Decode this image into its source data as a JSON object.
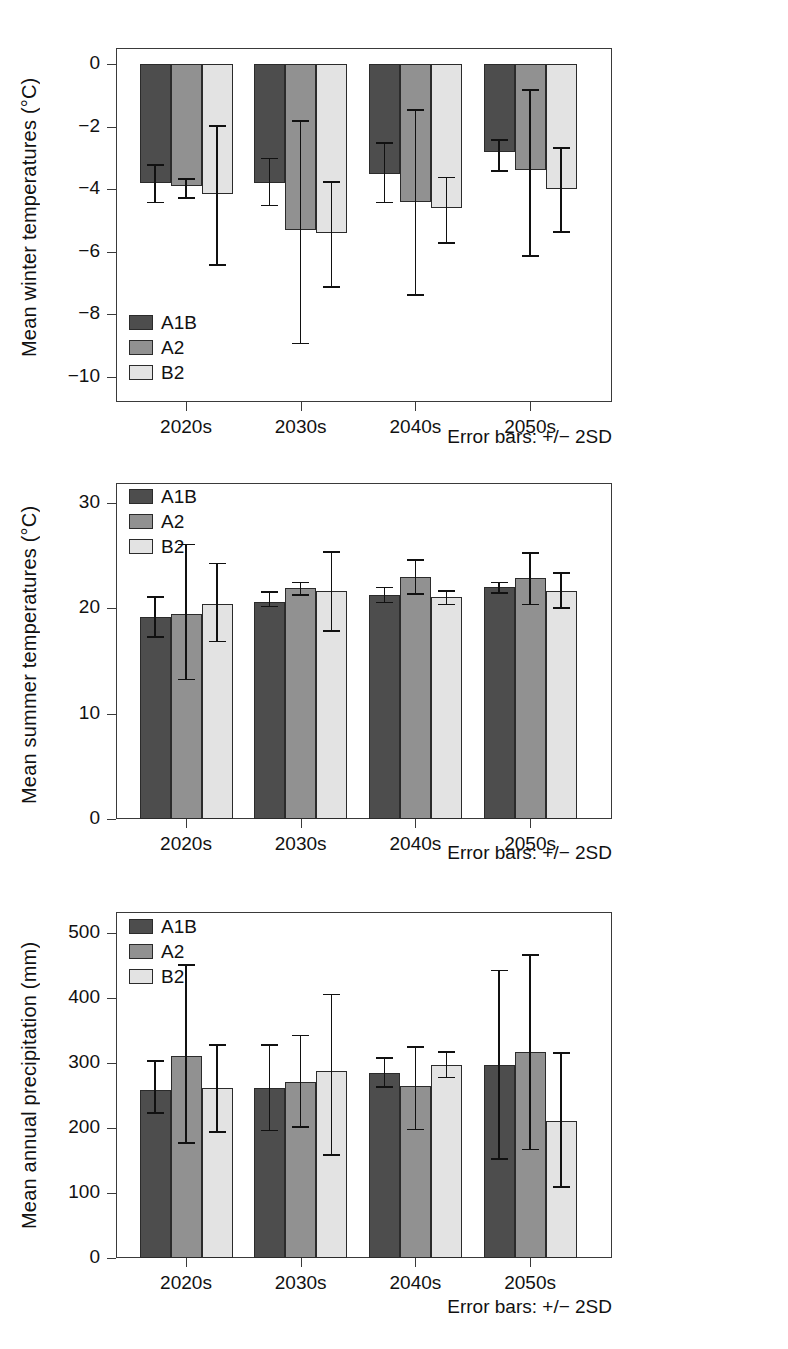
{
  "figure": {
    "series_names": [
      "A1B",
      "A2",
      "B2"
    ],
    "series_colors": [
      "#4d4d4d",
      "#919191",
      "#e3e3e3"
    ],
    "error_note": "Error bars: +/− 2SD"
  },
  "legend": {
    "a1b": "A1B",
    "a2": "A2",
    "b2": "B2"
  },
  "chart_data": [
    {
      "id": "winter",
      "type": "bar",
      "title": "",
      "xlabel": "",
      "ylabel": "Mean winter temperatures (°C)",
      "categories": [
        "2020s",
        "2030s",
        "2040s",
        "2050s"
      ],
      "yticks": [
        "0",
        "−2",
        "−4",
        "−6",
        "−8",
        "−10"
      ],
      "ytickvalues": [
        0,
        -2,
        -4,
        -6,
        -8,
        -10
      ],
      "ylim": [
        -10.6,
        0.55
      ],
      "grid": false,
      "legend_position": "lower-left-inside",
      "annotation": "Error bars: +/− 2SD",
      "series": [
        {
          "name": "A1B",
          "values": [
            -3.8,
            -3.8,
            -3.5,
            -2.8
          ],
          "err_low": [
            -4.4,
            -4.5,
            -4.4,
            -3.4
          ],
          "err_high": [
            -3.2,
            -3.0,
            -2.5,
            -2.4
          ]
        },
        {
          "name": "A2",
          "values": [
            -3.9,
            -5.3,
            -4.4,
            -3.4
          ],
          "err_low": [
            -4.25,
            -8.9,
            -7.35,
            -6.1
          ],
          "err_high": [
            -3.65,
            -1.8,
            -1.45,
            -0.8
          ]
        },
        {
          "name": "B2",
          "values": [
            -4.15,
            -5.4,
            -4.6,
            -4.0
          ],
          "err_low": [
            -6.4,
            -7.1,
            -5.7,
            -5.35
          ],
          "err_high": [
            -1.95,
            -3.75,
            -3.6,
            -2.65
          ]
        }
      ]
    },
    {
      "id": "summer",
      "type": "bar",
      "title": "",
      "xlabel": "",
      "ylabel": "Mean summer temperatures (°C)",
      "categories": [
        "2020s",
        "2030s",
        "2040s",
        "2050s"
      ],
      "yticks": [
        "30",
        "20",
        "10",
        "0"
      ],
      "ytickvalues": [
        30,
        20,
        10,
        0
      ],
      "ylim": [
        0,
        32
      ],
      "grid": false,
      "legend_position": "upper-left-inside",
      "annotation": "Error bars: +/− 2SD",
      "series": [
        {
          "name": "A1B",
          "values": [
            19.1,
            20.6,
            21.2,
            22.0
          ],
          "err_low": [
            17.3,
            20.2,
            20.6,
            21.5
          ],
          "err_high": [
            21.1,
            21.6,
            22.0,
            22.5
          ]
        },
        {
          "name": "A2",
          "values": [
            19.4,
            21.9,
            22.9,
            22.8
          ],
          "err_low": [
            13.3,
            21.3,
            21.4,
            20.4
          ],
          "err_high": [
            26.1,
            22.5,
            24.6,
            25.3
          ]
        },
        {
          "name": "B2",
          "values": [
            20.4,
            21.6,
            21.0,
            21.6
          ],
          "err_low": [
            16.9,
            17.9,
            20.4,
            20.1
          ],
          "err_high": [
            24.3,
            25.4,
            21.7,
            23.4
          ]
        }
      ]
    },
    {
      "id": "precipitation",
      "type": "bar",
      "title": "",
      "xlabel": "",
      "ylabel": "Mean annual precipitation (mm)",
      "categories": [
        "2020s",
        "2030s",
        "2040s",
        "2050s"
      ],
      "yticks": [
        "500",
        "400",
        "300",
        "200",
        "100",
        "0"
      ],
      "ytickvalues": [
        500,
        400,
        300,
        200,
        100,
        0
      ],
      "ylim": [
        0,
        530
      ],
      "grid": false,
      "legend_position": "upper-left-inside",
      "annotation": "Error bars: +/− 2SD",
      "series": [
        {
          "name": "A1B",
          "values": [
            259,
            262,
            285,
            296
          ],
          "err_low": [
            224,
            197,
            264,
            153
          ],
          "err_high": [
            304,
            329,
            309,
            443
          ]
        },
        {
          "name": "A2",
          "values": [
            311,
            270,
            265,
            317
          ],
          "err_low": [
            178,
            203,
            199,
            168
          ],
          "err_high": [
            452,
            343,
            326,
            467
          ]
        },
        {
          "name": "B2",
          "values": [
            262,
            287,
            297,
            211
          ],
          "err_low": [
            195,
            160,
            279,
            110
          ],
          "err_high": [
            329,
            406,
            318,
            316
          ]
        }
      ]
    }
  ]
}
